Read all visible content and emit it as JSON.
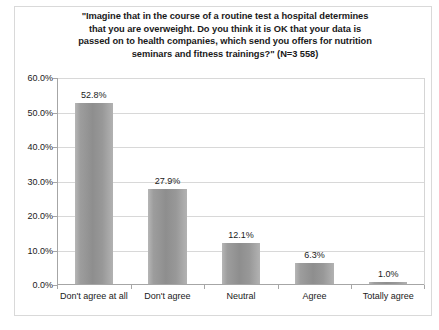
{
  "chart_data": {
    "type": "bar",
    "title_lines": [
      "\"Imagine that in the course of a routine test a hospital determines",
      "that you are overweight. Do you think it is OK that your data is",
      "passed on to health companies, which send you offers for nutrition",
      "seminars and fitness trainings?\" (N=3 558)"
    ],
    "categories": [
      "Don't agree at all",
      "Don't agree",
      "Neutral",
      "Agree",
      "Totally agree"
    ],
    "values": [
      52.8,
      27.9,
      12.1,
      6.3,
      1.0
    ],
    "value_labels": [
      "52.8%",
      "27.9%",
      "12.1%",
      "6.3%",
      "1.0%"
    ],
    "xlabel": "",
    "ylabel": "",
    "ylim": [
      0,
      60
    ],
    "ytick_values": [
      0,
      10,
      20,
      30,
      40,
      50,
      60
    ],
    "ytick_labels": [
      "0.0%",
      "10.0%",
      "20.0%",
      "30.0%",
      "40.0%",
      "50.0%",
      "60.0%"
    ],
    "grid": true,
    "legend": false,
    "sample_size": "N=3 558",
    "bar_color": "#969696",
    "gridline_color": "#d8d8d8",
    "axis_color": "#a6a6a6",
    "background_color": "#ffffff"
  }
}
